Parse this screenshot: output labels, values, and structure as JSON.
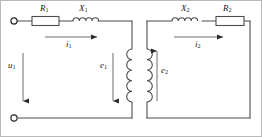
{
  "diagram": {
    "frame_color": "#b9b9b9",
    "wire_color": "#4d4d4d",
    "label_color": "#1a1a1a",
    "components": {
      "r1": {
        "label": "R",
        "sub": "1",
        "type": "resistor",
        "side": "primary"
      },
      "x1": {
        "label": "X",
        "sub": "1",
        "type": "inductor",
        "side": "primary"
      },
      "x2": {
        "label": "X",
        "sub": "2",
        "type": "inductor",
        "side": "secondary"
      },
      "r2": {
        "label": "R",
        "sub": "2",
        "type": "resistor",
        "side": "secondary"
      }
    },
    "currents": {
      "i1": {
        "label": "i",
        "sub": "1",
        "direction": "right",
        "side": "primary"
      },
      "i2": {
        "label": "i",
        "sub": "2",
        "direction": "right",
        "side": "secondary"
      }
    },
    "voltages": {
      "u1": {
        "label": "u",
        "sub": "1",
        "direction": "down",
        "side": "primary"
      },
      "e1": {
        "label": "e",
        "sub": "1",
        "direction": "down",
        "side": "primary"
      },
      "e2": {
        "label": "e",
        "sub": "2",
        "direction": "up",
        "side": "secondary"
      }
    },
    "windings": {
      "primary_coil": {
        "name": "primary-winding",
        "turns": 5,
        "orientation": "vertical"
      },
      "secondary_coil": {
        "name": "secondary-winding",
        "turns": 5,
        "orientation": "vertical"
      }
    },
    "terminals": [
      {
        "name": "terminal-top-left",
        "style": "open-circle"
      },
      {
        "name": "terminal-bottom-left",
        "style": "open-circle"
      }
    ]
  }
}
